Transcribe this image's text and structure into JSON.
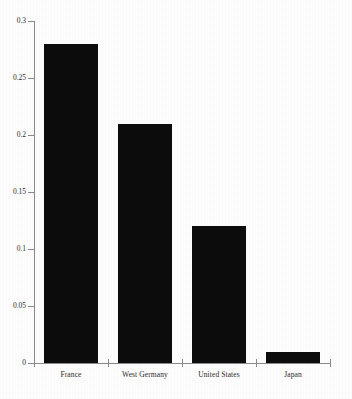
{
  "chart_data": {
    "type": "bar",
    "title": "",
    "subtitle": "",
    "xlabel": "",
    "ylabel": "",
    "categories": [
      "France",
      "West Germany",
      "United States",
      "Japan"
    ],
    "values": [
      0.28,
      0.21,
      0.12,
      0.01
    ],
    "ylim": [
      0,
      0.3
    ],
    "yticks": [
      0,
      0.05,
      0.1,
      0.15,
      0.2,
      0.25,
      0.3
    ],
    "ytick_labels": [
      "0",
      "0.05",
      "0.1",
      "0.15",
      "0.2",
      "0.25",
      "0.3"
    ],
    "grid": false,
    "legend": false,
    "legend_position": "none",
    "bar_color": "#0d0d0d",
    "axis_color": "#8a8a8a",
    "background_color": "#ffffff",
    "annotations": []
  }
}
